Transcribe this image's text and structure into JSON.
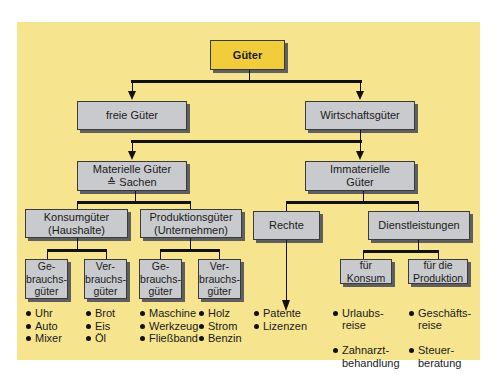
{
  "diagram": {
    "root": "Güter",
    "level1": {
      "left": "freie Güter",
      "right": "Wirtschaftsgüter"
    },
    "level2": {
      "left": "Materielle Güter\n≙ Sachen",
      "right": "Immaterielle\nGüter"
    },
    "level3": {
      "konsum": "Konsumgüter\n(Haushalte)",
      "produktion": "Produktionsgüter\n(Unternehmen)",
      "rechte": "Rechte",
      "dienst": "Dienstleistungen"
    },
    "level4": {
      "k_gebrauch": "Ge-\nbrauchs-\ngüter",
      "k_verbrauch": "Ver-\nbrauchs-\ngüter",
      "p_gebrauch": "Ge-\nbrauchs-\ngüter",
      "p_verbrauch": "Ver-\nbrauchs-\ngüter",
      "d_konsum": "für\nKonsum",
      "d_produktion": "für die\nProduktion"
    },
    "examples": {
      "k_gebrauch": [
        "Uhr",
        "Auto",
        "Mixer"
      ],
      "k_verbrauch": [
        "Brot",
        "Eis",
        "Öl"
      ],
      "p_gebrauch": [
        "Maschine",
        "Werkzeug",
        "Fließband"
      ],
      "p_verbrauch": [
        "Holz",
        "Strom",
        "Benzin"
      ],
      "rechte": [
        "Patente",
        "Lizenzen"
      ],
      "d_konsum": [
        "Urlaubs-\nreise",
        "Zahnarzt-\nbehandlung"
      ],
      "d_produktion": [
        "Geschäfts-\nreise",
        "Steuer-\nberatung"
      ]
    },
    "colors": {
      "background": "#f6e58e",
      "root_box": "#f1cd3c",
      "box": "#c8cacd"
    }
  }
}
